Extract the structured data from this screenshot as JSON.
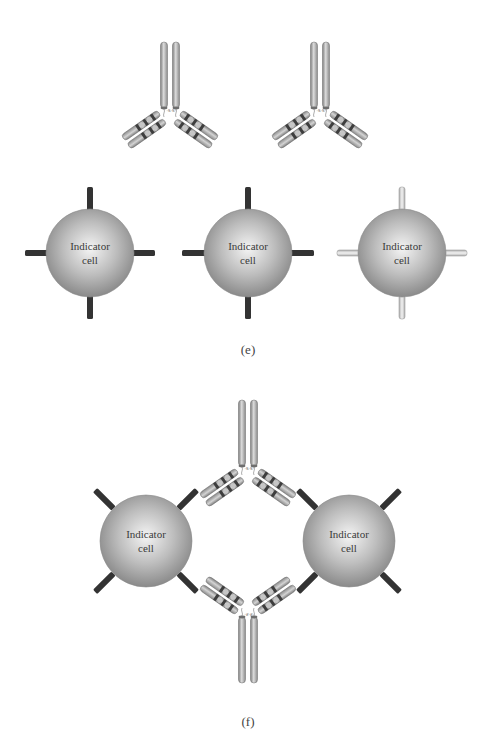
{
  "figure": {
    "panels": [
      {
        "id": "e",
        "label": "(e)",
        "antibodies": [
          {
            "name": "free-antibody-1",
            "center_x": 170,
            "hinge_y": 115,
            "orientation": "up"
          },
          {
            "name": "free-antibody-2",
            "center_x": 320,
            "hinge_y": 115,
            "orientation": "up"
          }
        ],
        "cells": [
          {
            "label_line1": "Indicator",
            "label_line2": "cell",
            "cx": 90,
            "cy": 253,
            "r": 44,
            "receptor_style": "dark"
          },
          {
            "label_line1": "Indicator",
            "label_line2": "cell",
            "cx": 248,
            "cy": 253,
            "r": 44,
            "receptor_style": "dark"
          },
          {
            "label_line1": "Indicator",
            "label_line2": "cell",
            "cx": 402,
            "cy": 253,
            "r": 44,
            "receptor_style": "light"
          }
        ]
      },
      {
        "id": "f",
        "label": "(f)",
        "antibodies": [
          {
            "name": "bridging-antibody-top",
            "center_x": 248,
            "hinge_y": 465,
            "orientation": "up"
          },
          {
            "name": "bridging-antibody-bottom",
            "center_x": 248,
            "hinge_y": 618,
            "orientation": "down"
          }
        ],
        "cells": [
          {
            "label_line1": "Indicator",
            "label_line2": "cell",
            "cx": 146,
            "cy": 541,
            "r": 46,
            "receptor_style": "dark"
          },
          {
            "label_line1": "Indicator",
            "label_line2": "cell",
            "cx": 349,
            "cy": 541,
            "r": 46,
            "receptor_style": "dark"
          }
        ]
      }
    ],
    "disulfide_label": "-S-S-",
    "colors": {
      "background": "#ffffff",
      "heavy_chain": "#9a9a9a",
      "heavy_chain_highlight": "#d6d6d6",
      "band_dark": "#3e3e3e",
      "band_light": "#c8c8c8",
      "cell_center": "#f2f2f2",
      "cell_edge": "#8c8c8c",
      "receptor_dark": "#333333",
      "receptor_light": "#dcdcdc",
      "text": "#3a3a3a"
    }
  }
}
